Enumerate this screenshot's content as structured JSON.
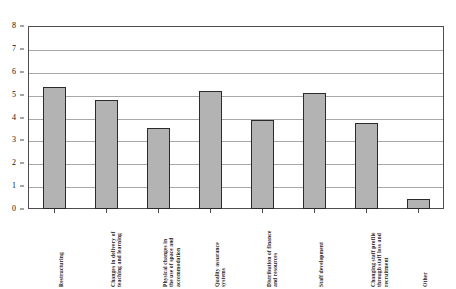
{
  "chart_data": {
    "type": "bar",
    "title": "",
    "subtitle": "",
    "xlabel": "",
    "ylabel": "",
    "ylim": [
      0,
      8
    ],
    "ytick_values": [
      8,
      7,
      6,
      5,
      4,
      3,
      2,
      1,
      0
    ],
    "ytick_labels": [
      "8",
      "7",
      "6",
      "5",
      "4",
      "3",
      "2",
      "1",
      "0"
    ],
    "grid": true,
    "legend": false,
    "legend_position": "none",
    "categories": [
      "Restructuring",
      "Changes in delivery of\nteaching and learning",
      "Physical changes in\nthe use of space and\naccommodation",
      "Quality assurance\nsystems",
      "Distribution of finance\nand resources",
      "Staff development",
      "Changing staff profile\nthrough staff loss and\nrecruitment",
      "Other"
    ],
    "values": [
      5.35,
      4.75,
      3.55,
      5.15,
      3.88,
      5.05,
      3.78,
      0.43
    ],
    "bar_color": "#b3b3b3",
    "bar_border_color": "#2b2b2b",
    "grid_color": "#a8a8a8",
    "axis_color": "#4d4d4d",
    "background_color": "#ffffff"
  }
}
